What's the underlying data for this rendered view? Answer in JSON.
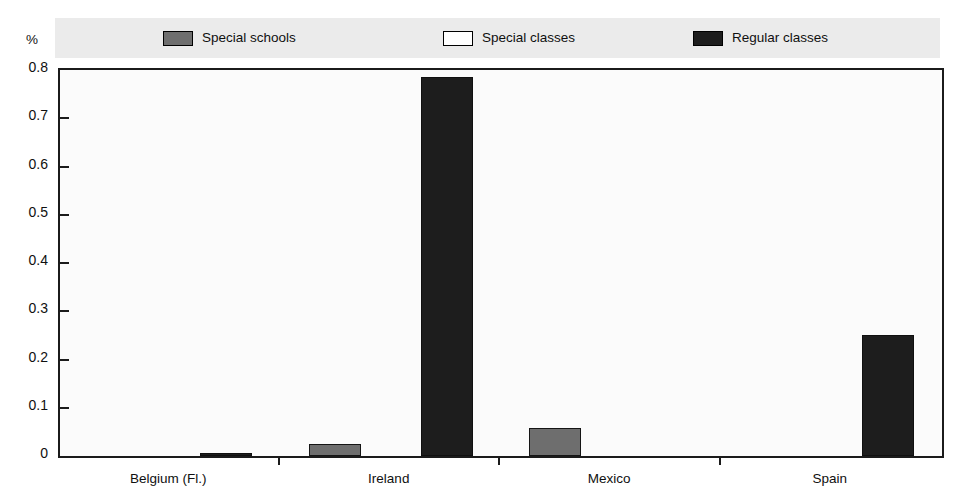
{
  "chart_data": {
    "type": "bar",
    "title": "",
    "subtitle": "",
    "xlabel": "",
    "ylabel": "",
    "unit_label": "%",
    "categories": [
      "Belgium (Fl.)",
      "Ireland",
      "Mexico",
      "Spain"
    ],
    "series": [
      {
        "name": "Special schools",
        "color": "#6e6e6e",
        "values": [
          0,
          0.025,
          0.058,
          0
        ]
      },
      {
        "name": "Special classes",
        "color": "#ffffff",
        "values": [
          0,
          0,
          0,
          0
        ]
      },
      {
        "name": "Regular classes",
        "color": "#1d1d1d",
        "values": [
          0.007,
          0.785,
          0,
          0.25
        ]
      }
    ],
    "ylim": [
      0,
      0.8
    ],
    "yticks": [
      0,
      0.1,
      0.2,
      0.3,
      0.4,
      0.5,
      0.6,
      0.7,
      0.8
    ],
    "ytick_labels": [
      "0",
      "0.1",
      "0.2",
      "0.3",
      "0.4",
      "0.5",
      "0.6",
      "0.7",
      "0.8"
    ],
    "grid": false,
    "legend_position": "top",
    "legend": [
      {
        "label": "Special schools",
        "swatch": "#6e6e6e"
      },
      {
        "label": "Special classes",
        "swatch": "#ffffff"
      },
      {
        "label": "Regular classes",
        "swatch": "#1d1d1d"
      }
    ]
  }
}
